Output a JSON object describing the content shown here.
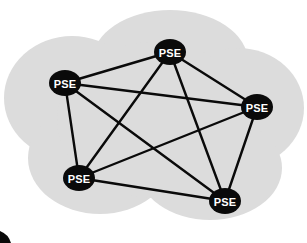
{
  "diagram": {
    "type": "network-graph",
    "background_color": "#ffffff",
    "cloud": {
      "name": "network-cloud",
      "fill_color": "#dcdcdc",
      "stroke_color": "none",
      "lobes": [
        {
          "cx": 170,
          "cy": 62,
          "rx": 78,
          "ry": 52
        },
        {
          "cx": 72,
          "cy": 98,
          "rx": 68,
          "ry": 62
        },
        {
          "cx": 238,
          "cy": 108,
          "rx": 66,
          "ry": 60
        },
        {
          "cx": 100,
          "cy": 158,
          "rx": 72,
          "ry": 56
        },
        {
          "cx": 210,
          "cy": 168,
          "rx": 72,
          "ry": 52
        },
        {
          "cx": 155,
          "cy": 120,
          "rx": 98,
          "ry": 78
        }
      ]
    },
    "edge_style": {
      "color": "#0a0a0a",
      "width": 2.4
    },
    "node_style": {
      "fill_color": "#0a0a0a",
      "text_color": "#ffffff",
      "rx": 16,
      "ry": 13
    },
    "nodes": [
      {
        "id": "pse-top",
        "label": "PSE",
        "x": 170,
        "y": 52
      },
      {
        "id": "pse-upper-left",
        "label": "PSE",
        "x": 65,
        "y": 83
      },
      {
        "id": "pse-right",
        "label": "PSE",
        "x": 257,
        "y": 107
      },
      {
        "id": "pse-lower-left",
        "label": "PSE",
        "x": 79,
        "y": 178
      },
      {
        "id": "pse-bottom-right",
        "label": "PSE",
        "x": 225,
        "y": 201
      }
    ],
    "edges": [
      {
        "from": "pse-top",
        "to": "pse-upper-left"
      },
      {
        "from": "pse-top",
        "to": "pse-right"
      },
      {
        "from": "pse-top",
        "to": "pse-lower-left"
      },
      {
        "from": "pse-top",
        "to": "pse-bottom-right"
      },
      {
        "from": "pse-upper-left",
        "to": "pse-right"
      },
      {
        "from": "pse-upper-left",
        "to": "pse-lower-left"
      },
      {
        "from": "pse-upper-left",
        "to": "pse-bottom-right"
      },
      {
        "from": "pse-right",
        "to": "pse-lower-left"
      },
      {
        "from": "pse-right",
        "to": "pse-bottom-right"
      },
      {
        "from": "pse-lower-left",
        "to": "pse-bottom-right"
      }
    ],
    "corner_mark": {
      "name": "corner-artifact",
      "x": 0,
      "y": 231,
      "width": 11,
      "height": 12,
      "color": "#0a0a0a"
    }
  }
}
